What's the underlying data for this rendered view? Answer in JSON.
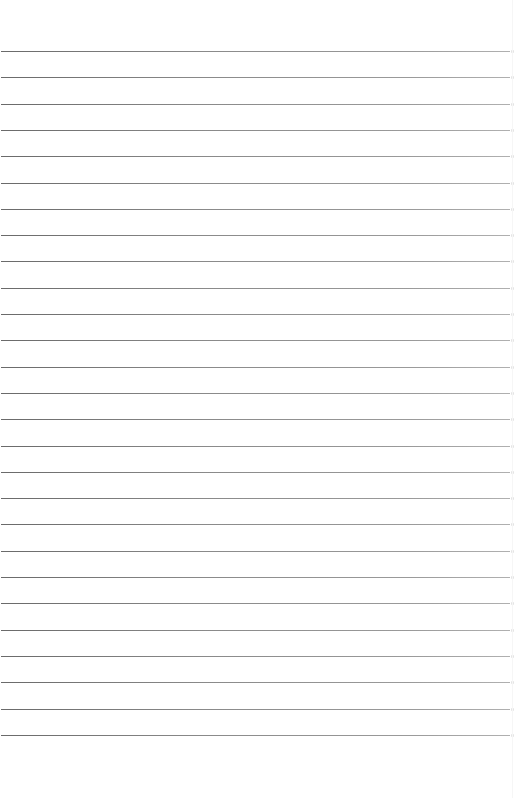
{
  "document": {
    "type": "lined-paper",
    "background_color": "#ffffff",
    "rule_color": "#7a7a7a",
    "rule_count": 27,
    "first_rule_y": 51,
    "rule_spacing": 26.3,
    "text_content": ""
  }
}
